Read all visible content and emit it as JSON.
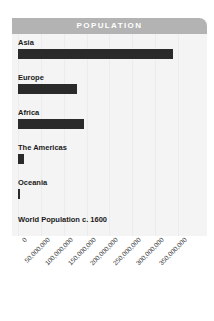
{
  "header": {
    "title": "POPULATION"
  },
  "colors": {
    "header_bar": "#b3b3b3",
    "header_text": "#ffffff",
    "panel_background": "#f4f4f4",
    "bar": "#2a2a2a",
    "label_text": "#1a1a1a",
    "tick_text": "#3a3a3a",
    "gridline": "#ececec"
  },
  "footer": {
    "caption": "World Population c. 1600"
  },
  "chart_data": {
    "type": "bar",
    "title": "POPULATION",
    "orientation": "horizontal",
    "xlabel": "",
    "ylabel": "",
    "categories": [
      "Asia",
      "Europe",
      "Africa",
      "The Americas",
      "Oceania"
    ],
    "values": [
      340000000,
      130000000,
      145000000,
      13000000,
      3000000
    ],
    "value_labels": [
      "340,000,000",
      "130,000,000",
      "145,000,000",
      "13,000,000",
      "3,000,000"
    ],
    "xlim": [
      0,
      350000000
    ],
    "tick_values": [
      0,
      50000000,
      100000000,
      150000000,
      200000000,
      250000000,
      300000000,
      350000000
    ],
    "tick_labels": [
      "0",
      "50,000,000",
      "100,000,000",
      "150,000,000",
      "200,000,000",
      "250,000,000",
      "300,000,000",
      "350,000,000"
    ],
    "grid": true,
    "legend": "none",
    "annotation": "World Population c. 1600"
  }
}
